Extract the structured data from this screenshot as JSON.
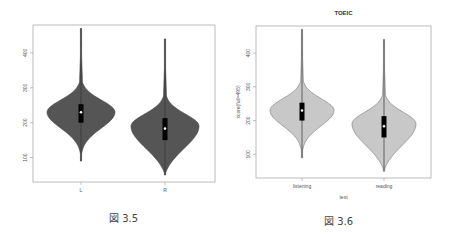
{
  "chart_data": [
    {
      "type": "violin",
      "title": "",
      "xlabel": "",
      "ylabel": "",
      "caption": "図 3.5",
      "categories": [
        "L",
        "R"
      ],
      "yticks": [
        100,
        200,
        300,
        400
      ],
      "ylim": [
        30,
        480
      ],
      "fill_color": "#555555",
      "outline_color": "#444444",
      "series": [
        {
          "name": "L",
          "min": 90,
          "max": 470,
          "q1": 200,
          "median": 230,
          "q3": 253,
          "mode": 230
        },
        {
          "name": "R",
          "min": 50,
          "max": 440,
          "q1": 150,
          "median": 183,
          "q3": 213,
          "mode": 190
        }
      ]
    },
    {
      "type": "violin",
      "title": "TOEIC",
      "xlabel": "test",
      "ylabel": "score(full=495)",
      "caption": "図 3.6",
      "categories": [
        "listening",
        "reading"
      ],
      "yticks": [
        100,
        200,
        300,
        400
      ],
      "ylim": [
        30,
        480
      ],
      "fill_color": "#c8c8c8",
      "outline_color": "#777777",
      "series": [
        {
          "name": "listening",
          "min": 90,
          "max": 470,
          "q1": 200,
          "median": 230,
          "q3": 253,
          "mode": 230
        },
        {
          "name": "reading",
          "min": 50,
          "max": 440,
          "q1": 150,
          "median": 183,
          "q3": 213,
          "mode": 190
        }
      ]
    }
  ]
}
